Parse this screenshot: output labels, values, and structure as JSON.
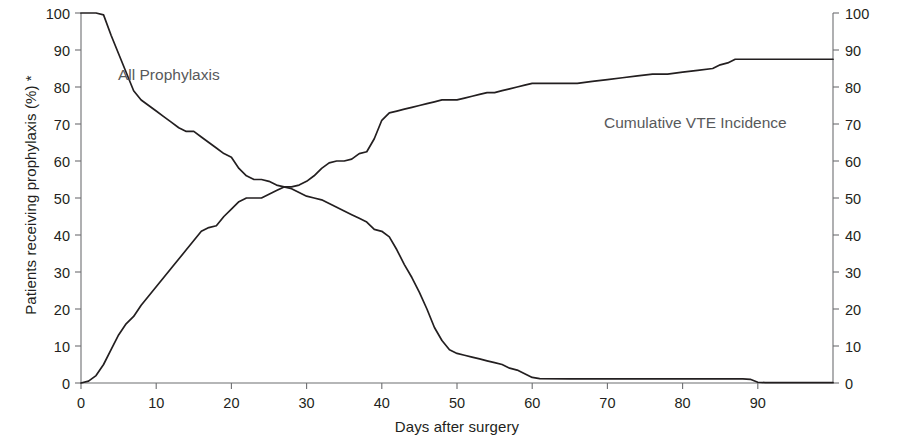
{
  "chart_data": {
    "type": "line",
    "title": "",
    "xlabel": "Days after surgery",
    "ylabel": "Patients receiving prophylaxis (%) *",
    "y2label": "Cumulative VTE incidence (number of events)",
    "xlim": [
      0,
      100
    ],
    "ylim": [
      0,
      100
    ],
    "y2lim": [
      0,
      100
    ],
    "grid": false,
    "legend_position": "inline-annotations",
    "xticks": [
      0,
      10,
      20,
      30,
      40,
      50,
      60,
      70,
      80,
      90
    ],
    "yticks": [
      0,
      10,
      20,
      30,
      40,
      50,
      60,
      70,
      80,
      90,
      100
    ],
    "y2ticks": [
      0,
      10,
      20,
      30,
      40,
      50,
      60,
      70,
      80,
      90,
      100
    ],
    "annotations": [
      {
        "text": "All Prophylaxis",
        "x": 5,
        "y": 84
      },
      {
        "text": "Cumulative VTE Incidence",
        "x": 70,
        "y": 72
      }
    ],
    "series": [
      {
        "name": "All Prophylaxis",
        "axis": "left",
        "units": "percent",
        "color": "#231f20",
        "x": [
          0,
          1,
          2,
          3,
          4,
          5,
          6,
          7,
          8,
          9,
          10,
          11,
          12,
          13,
          14,
          15,
          16,
          17,
          18,
          19,
          20,
          21,
          22,
          23,
          24,
          25,
          26,
          27,
          28,
          29,
          30,
          31,
          32,
          33,
          34,
          35,
          36,
          37,
          38,
          39,
          40,
          41,
          42,
          43,
          44,
          45,
          46,
          47,
          48,
          49,
          50,
          51,
          52,
          53,
          54,
          55,
          56,
          57,
          58,
          59,
          60,
          61,
          65,
          70,
          75,
          80,
          85,
          88,
          89,
          90,
          91,
          95,
          100
        ],
        "values": [
          100,
          100,
          100,
          99.5,
          94,
          89,
          84,
          79,
          76.5,
          75,
          73.5,
          72,
          70.5,
          69,
          68,
          68,
          66.5,
          65,
          63.5,
          62,
          61,
          58,
          56,
          55,
          55,
          54.5,
          53.5,
          53,
          52.5,
          51.5,
          50.5,
          50,
          49.5,
          48.5,
          47.5,
          46.5,
          45.5,
          44.5,
          43.5,
          41.5,
          41,
          39.5,
          36,
          32,
          28.5,
          24.5,
          20,
          15,
          11.5,
          9,
          8,
          7.5,
          7,
          6.5,
          6,
          5.5,
          5,
          4,
          3.5,
          2.5,
          1.5,
          1.2,
          1.1,
          1.1,
          1.1,
          1.1,
          1.1,
          1.1,
          1.0,
          0.2,
          0.1,
          0.1,
          0.1
        ]
      },
      {
        "name": "Cumulative VTE Incidence",
        "axis": "right",
        "units": "events",
        "color": "#231f20",
        "x": [
          0,
          1,
          2,
          3,
          4,
          5,
          6,
          7,
          8,
          9,
          10,
          11,
          12,
          13,
          14,
          15,
          16,
          17,
          18,
          19,
          20,
          21,
          22,
          23,
          24,
          25,
          26,
          27,
          28,
          29,
          30,
          31,
          32,
          33,
          34,
          35,
          36,
          37,
          38,
          39,
          40,
          41,
          42,
          43,
          44,
          45,
          46,
          47,
          48,
          49,
          50,
          51,
          52,
          53,
          54,
          55,
          56,
          57,
          58,
          59,
          60,
          62,
          64,
          66,
          68,
          70,
          72,
          74,
          76,
          78,
          80,
          82,
          84,
          85,
          86,
          87,
          88,
          90,
          95,
          100
        ],
        "values": [
          0,
          0.5,
          2,
          5,
          9,
          13,
          16,
          18,
          21,
          23.5,
          26,
          28.5,
          31,
          33.5,
          36,
          38.5,
          41,
          42,
          42.5,
          45,
          47,
          49,
          50,
          50,
          50,
          51,
          52,
          53,
          53,
          53.5,
          54.5,
          56,
          58,
          59.5,
          60,
          60,
          60.5,
          62,
          62.5,
          66,
          71,
          73,
          73.5,
          74,
          74.5,
          75,
          75.5,
          76,
          76.5,
          76.5,
          76.5,
          77,
          77.5,
          78,
          78.5,
          78.5,
          79,
          79.5,
          80,
          80.5,
          81,
          81,
          81,
          81,
          81.5,
          82,
          82.5,
          83,
          83.5,
          83.5,
          84,
          84.5,
          85,
          86,
          86.5,
          87.5,
          87.5,
          87.5,
          87.5,
          87.5
        ]
      }
    ]
  },
  "axes": {
    "x_title": "Days after surgery",
    "y_left_title": "Patients receiving prophylaxis (%) *",
    "y_right_title": "Cumulative VTE incidence (number of events)"
  },
  "labels": {
    "prophylaxis": "All Prophylaxis",
    "vte": "Cumulative VTE Incidence"
  },
  "colors": {
    "line": "#231f20",
    "axis": "#6d6e71",
    "text": "#231f20",
    "annotation": "#58595b",
    "background": "#ffffff"
  }
}
